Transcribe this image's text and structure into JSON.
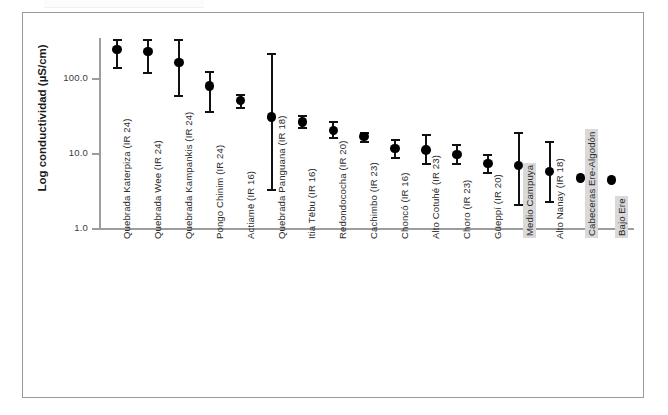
{
  "chart_data": {
    "type": "scatter",
    "title": "",
    "xlabel": "",
    "ylabel": "Log conductividad (µS/cm)",
    "yscale": "log",
    "ylim": [
      1.0,
      400.0
    ],
    "ytick_labels": [
      "100.0",
      "10.0",
      "1.0"
    ],
    "ytick_values": [
      100.0,
      10.0,
      1.0
    ],
    "grid": false,
    "legend": null,
    "error_bar_style": "vertical-with-caps",
    "marker": "filled-circle",
    "categories": [
      "Quebrada Katerpiza (IR 24)",
      "Quebrada Wee (IR 24)",
      "Quebrada Kampankis (IR 24)",
      "Pongo Chinim (IR 24)",
      "Actiamë (IR 16)",
      "Quebrada Panguana (IR 18)",
      "Itia Tëbu (IR 16)",
      "Redondococha (IR 20)",
      "Cachimbo (IR 23)",
      "Choncó (IR 16)",
      "Alto Cotuhé (IR 23)",
      "Choro (IR 23)",
      "Güeppí (IR 20)",
      "Medio Campuya",
      "Alto Nanay (IR 18)",
      "Cabeceras Ere-Algodón",
      "Bajo Ere"
    ],
    "highlighted_categories": [
      "Medio Campuya",
      "Cabeceras Ere-Algodón",
      "Bajo Ere"
    ],
    "values": [
      240,
      225,
      160,
      78,
      50,
      30,
      26,
      20,
      16.5,
      11.5,
      11,
      9.6,
      7.2,
      6.8,
      5.7,
      4.6,
      4.4
    ],
    "error_low": [
      140,
      120,
      60,
      36,
      41,
      3.3,
      22,
      16.5,
      14.5,
      8.8,
      7.4,
      7.4,
      5.6,
      2.1,
      2.3,
      4.6,
      4.4
    ],
    "error_high": [
      330,
      330,
      330,
      125,
      62,
      215,
      32,
      27,
      19,
      15.5,
      18,
      13.2,
      9.6,
      19,
      14.5,
      4.6,
      4.4
    ]
  }
}
